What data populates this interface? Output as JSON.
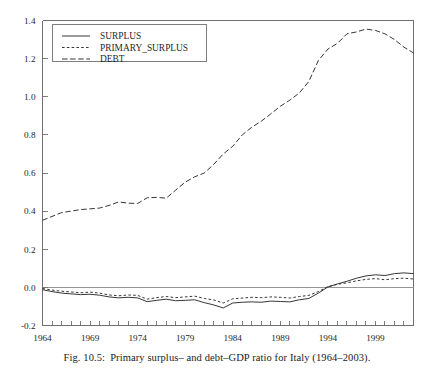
{
  "figure": {
    "caption_label": "Fig. 10.5:",
    "caption_text": "Primary surplus– and debt–GDP ratio for Italy (1964–2003)."
  },
  "chart_data": {
    "type": "line",
    "title": "",
    "xlabel": "",
    "ylabel": "",
    "xlim": [
      1964,
      2003
    ],
    "ylim": [
      -0.2,
      1.4
    ],
    "grid": false,
    "legend_position": "top-left",
    "ytick_labels": [
      "1.4",
      "1.2",
      "1.0",
      "0.8",
      "0.6",
      "0.4",
      "0.2",
      "0.0",
      "-0.2"
    ],
    "ytick_values": [
      1.4,
      1.2,
      1.0,
      0.8,
      0.6,
      0.4,
      0.2,
      0.0,
      -0.2
    ],
    "xtick_labels": [
      "1964",
      "1969",
      "1974",
      "1979",
      "1984",
      "1989",
      "1994",
      "1999"
    ],
    "xtick_values": [
      1964,
      1969,
      1974,
      1979,
      1984,
      1989,
      1994,
      1999
    ],
    "x": [
      1964,
      1965,
      1966,
      1967,
      1968,
      1969,
      1970,
      1971,
      1972,
      1973,
      1974,
      1975,
      1976,
      1977,
      1978,
      1979,
      1980,
      1981,
      1982,
      1983,
      1984,
      1985,
      1986,
      1987,
      1988,
      1989,
      1990,
      1991,
      1992,
      1993,
      1994,
      1995,
      1996,
      1997,
      1998,
      1999,
      2000,
      2001,
      2002,
      2003
    ],
    "series": [
      {
        "name": "SURPLUS",
        "style": "solid",
        "values": [
          -0.012,
          -0.022,
          -0.03,
          -0.034,
          -0.038,
          -0.036,
          -0.041,
          -0.05,
          -0.055,
          -0.052,
          -0.055,
          -0.075,
          -0.068,
          -0.062,
          -0.07,
          -0.068,
          -0.065,
          -0.08,
          -0.092,
          -0.108,
          -0.082,
          -0.078,
          -0.076,
          -0.078,
          -0.072,
          -0.074,
          -0.076,
          -0.065,
          -0.058,
          -0.03,
          0.002,
          0.018,
          0.032,
          0.048,
          0.06,
          0.066,
          0.062,
          0.072,
          0.076,
          0.072
        ]
      },
      {
        "name": "PRIMARY_SURPLUS",
        "style": "dotted",
        "values": [
          -0.006,
          -0.014,
          -0.02,
          -0.024,
          -0.028,
          -0.025,
          -0.03,
          -0.04,
          -0.044,
          -0.04,
          -0.042,
          -0.062,
          -0.054,
          -0.048,
          -0.054,
          -0.05,
          -0.046,
          -0.058,
          -0.066,
          -0.082,
          -0.06,
          -0.056,
          -0.052,
          -0.054,
          -0.05,
          -0.052,
          -0.056,
          -0.048,
          -0.042,
          -0.022,
          0.004,
          0.016,
          0.024,
          0.034,
          0.042,
          0.046,
          0.04,
          0.046,
          0.048,
          0.044
        ]
      },
      {
        "name": "DEBT",
        "style": "dashed",
        "values": [
          0.352,
          0.372,
          0.392,
          0.4,
          0.408,
          0.412,
          0.416,
          0.43,
          0.448,
          0.442,
          0.44,
          0.47,
          0.472,
          0.468,
          0.51,
          0.552,
          0.58,
          0.6,
          0.645,
          0.7,
          0.74,
          0.8,
          0.84,
          0.872,
          0.91,
          0.95,
          0.982,
          1.02,
          1.08,
          1.19,
          1.25,
          1.28,
          1.33,
          1.34,
          1.355,
          1.348,
          1.33,
          1.3,
          1.26,
          1.23
        ]
      }
    ],
    "legend_entries": [
      {
        "label": "SURPLUS",
        "style": "solid"
      },
      {
        "label": "PRIMARY_SURPLUS",
        "style": "dotted"
      },
      {
        "label": "DEBT",
        "style": "dashed"
      }
    ]
  }
}
